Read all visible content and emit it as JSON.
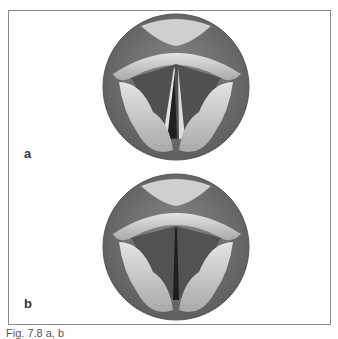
{
  "figure": {
    "panels": [
      {
        "label": "a",
        "description": "Laryngoscopic view of vocal folds, glottis open (abducted)"
      },
      {
        "label": "b",
        "description": "Laryngoscopic view of vocal folds, glottis nearly closed (narrow slit)"
      }
    ],
    "caption": "Fig. 7.8 a, b",
    "colors": {
      "ring": "#6e6e6e",
      "fold_light": "#d8d8d8",
      "fold_mid": "#a8a8a8",
      "airway_dark": "#3a3a3a",
      "frame": "#8a8a8a"
    }
  }
}
